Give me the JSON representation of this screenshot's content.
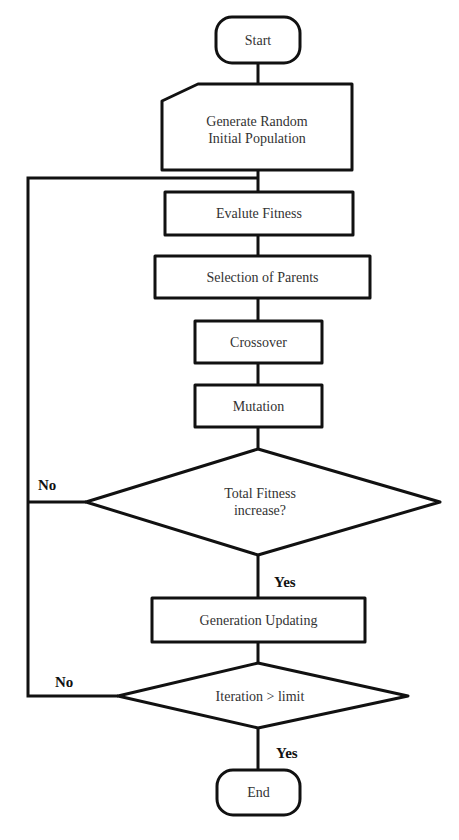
{
  "diagram": {
    "type": "flowchart",
    "nodes": {
      "start": {
        "label": "Start",
        "shape": "terminator"
      },
      "init_population": {
        "label": "Generate Random\nInitial Population",
        "shape": "manual-input"
      },
      "evaluate_fitness": {
        "label": "Evalute Fitness",
        "shape": "process"
      },
      "selection": {
        "label": "Selection of Parents",
        "shape": "process"
      },
      "crossover": {
        "label": "Crossover",
        "shape": "process"
      },
      "mutation": {
        "label": "Mutation",
        "shape": "process"
      },
      "fitness_decision": {
        "label": "Total Fitness\nincrease?",
        "shape": "decision"
      },
      "generation_update": {
        "label": "Generation Updating",
        "shape": "process"
      },
      "iteration_decision": {
        "label": "Iteration > limit",
        "shape": "decision"
      },
      "end": {
        "label": "End",
        "shape": "terminator"
      }
    },
    "branch_labels": {
      "fitness_no": "No",
      "fitness_yes": "Yes",
      "iteration_no": "No",
      "iteration_yes": "Yes"
    },
    "edges": [
      {
        "from": "start",
        "to": "init_population"
      },
      {
        "from": "init_population",
        "to": "evaluate_fitness"
      },
      {
        "from": "evaluate_fitness",
        "to": "selection"
      },
      {
        "from": "selection",
        "to": "crossover"
      },
      {
        "from": "crossover",
        "to": "mutation"
      },
      {
        "from": "mutation",
        "to": "fitness_decision"
      },
      {
        "from": "fitness_decision",
        "to": "generation_update",
        "label": "Yes"
      },
      {
        "from": "fitness_decision",
        "to": "evaluate_fitness",
        "label": "No"
      },
      {
        "from": "generation_update",
        "to": "iteration_decision"
      },
      {
        "from": "iteration_decision",
        "to": "end",
        "label": "Yes"
      },
      {
        "from": "iteration_decision",
        "to": "evaluate_fitness",
        "label": "No"
      }
    ],
    "colors": {
      "stroke": "#111111",
      "fill": "#ffffff",
      "text": "#333333"
    }
  }
}
